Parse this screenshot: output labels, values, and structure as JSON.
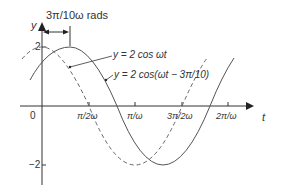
{
  "diagram": {
    "phase_label": "3π/10ω rads",
    "axes": {
      "y_label": "y",
      "x_label": "t",
      "origin_label": "0",
      "y_ticks": [
        {
          "label": "2",
          "value": 2
        },
        {
          "label": "−2",
          "value": -2
        }
      ],
      "x_ticks": [
        {
          "label": "π/2ω",
          "value": 0.25
        },
        {
          "label": "π/ω",
          "value": 0.5
        },
        {
          "label": "3π/2ω",
          "value": 0.75
        },
        {
          "label": "2π/ω",
          "value": 1.0
        }
      ]
    },
    "curves": [
      {
        "name": "reference",
        "label": "y = 2 cos ωt",
        "style": "dashed",
        "amplitude": 2,
        "phase_shift": 0
      },
      {
        "name": "lagging",
        "label": "y = 2 cos(ωt − 3π/10)",
        "style": "solid",
        "amplitude": 2,
        "phase_shift": "3π/10"
      }
    ],
    "colors": {
      "line": "#555555",
      "axis": "#333333",
      "text": "#333333"
    }
  }
}
